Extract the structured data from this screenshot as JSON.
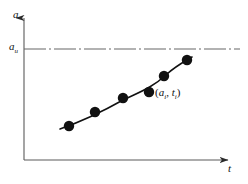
{
  "figure": {
    "background_color": "#ffffff",
    "ink_color": "#1a1a1a",
    "axis_color": "#555555",
    "asymptote_color": "#666666"
  },
  "labels": {
    "y_axis": "a",
    "y_tick": "a",
    "y_tick_subscript": "u",
    "x_axis": "t",
    "annotation_open": "(",
    "annotation_a": "a",
    "annotation_a_sub": "i",
    "annotation_comma": ", ",
    "annotation_t": "t",
    "annotation_t_sub": "i",
    "annotation_close": ")"
  },
  "chart_data": {
    "type": "scatter",
    "title": "",
    "xlabel": "t",
    "ylabel": "a",
    "grid": false,
    "legend": "none",
    "xlim": [
      0,
      1
    ],
    "ylim": [
      0,
      1
    ],
    "series": [
      {
        "name": "measured points",
        "marker": "filled-circle",
        "marker_color": "#111111",
        "marker_size_px": 6,
        "x": [
          0.21,
          0.33,
          0.47,
          0.6,
          0.72,
          0.85
        ],
        "y": [
          0.3,
          0.37,
          0.46,
          0.54,
          0.65,
          0.77
        ],
        "pixel_points": [
          {
            "cx": 69,
            "cy": 126
          },
          {
            "cx": 95,
            "cy": 112
          },
          {
            "cx": 123,
            "cy": 98
          },
          {
            "cx": 149,
            "cy": 92
          },
          {
            "cx": 164,
            "cy": 76
          },
          {
            "cx": 187,
            "cy": 60
          }
        ]
      },
      {
        "name": "fitted curve",
        "type": "line",
        "color": "#111111",
        "width_px": 1.6,
        "path": "M 60 129 C 80 122, 100 113, 123 100 C 140 92, 152 88, 167 74 C 176 66, 182 63, 192 57"
      }
    ],
    "annotations": [
      {
        "text": "(a_i, t_i)",
        "x_px": 155,
        "y_px": 93,
        "refers_to": "fourth data point"
      }
    ],
    "reference_lines": [
      {
        "name": "asymptote",
        "orientation": "horizontal",
        "value_label": "a_u",
        "style": "dash-dot",
        "y_px": 49,
        "x_start_px": 24,
        "x_end_px": 240,
        "color": "#666666"
      }
    ],
    "axes": {
      "y_axis": {
        "x_px": 24,
        "y_top_px": 14,
        "y_bottom_px": 160,
        "arrow": "up"
      },
      "x_axis": {
        "y_px": 160,
        "x_left_px": 24,
        "x_right_px": 234,
        "arrow": "right"
      }
    }
  }
}
